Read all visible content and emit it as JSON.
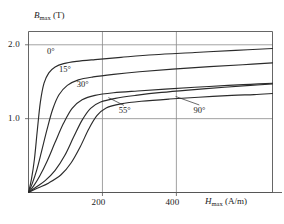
{
  "chart_data": {
    "type": "line",
    "title": "",
    "xlabel": "H_max (A/m)",
    "ylabel": "B_max (T)",
    "xlim": [
      0,
      660
    ],
    "ylim": [
      0,
      2.18
    ],
    "grid": true,
    "legend_position": "inline-annotations",
    "x_ticks": [
      {
        "value": 200,
        "label": "200"
      },
      {
        "value": 400,
        "label": "400"
      }
    ],
    "y_ticks": [
      {
        "value": 1.0,
        "label": "1.0"
      },
      {
        "value": 2.0,
        "label": "2.0"
      }
    ],
    "series": [
      {
        "name": "0°",
        "label": "0°",
        "points": [
          [
            0,
            0.0
          ],
          [
            8,
            0.18
          ],
          [
            16,
            0.45
          ],
          [
            24,
            0.85
          ],
          [
            32,
            1.22
          ],
          [
            42,
            1.48
          ],
          [
            55,
            1.62
          ],
          [
            72,
            1.7
          ],
          [
            95,
            1.745
          ],
          [
            130,
            1.775
          ],
          [
            180,
            1.8
          ],
          [
            250,
            1.83
          ],
          [
            340,
            1.865
          ],
          [
            450,
            1.895
          ],
          [
            560,
            1.925
          ],
          [
            660,
            1.95
          ]
        ]
      },
      {
        "name": "15°",
        "label": "15°",
        "points": [
          [
            0,
            0.0
          ],
          [
            10,
            0.12
          ],
          [
            22,
            0.3
          ],
          [
            35,
            0.55
          ],
          [
            50,
            0.85
          ],
          [
            65,
            1.12
          ],
          [
            82,
            1.32
          ],
          [
            105,
            1.45
          ],
          [
            135,
            1.525
          ],
          [
            175,
            1.565
          ],
          [
            230,
            1.6
          ],
          [
            300,
            1.635
          ],
          [
            390,
            1.67
          ],
          [
            490,
            1.705
          ],
          [
            580,
            1.73
          ],
          [
            660,
            1.755
          ]
        ]
      },
      {
        "name": "30°",
        "label": "30°",
        "points": [
          [
            0,
            0.0
          ],
          [
            14,
            0.09
          ],
          [
            30,
            0.22
          ],
          [
            50,
            0.42
          ],
          [
            72,
            0.68
          ],
          [
            95,
            0.94
          ],
          [
            118,
            1.14
          ],
          [
            145,
            1.255
          ],
          [
            180,
            1.315
          ],
          [
            230,
            1.35
          ],
          [
            295,
            1.375
          ],
          [
            370,
            1.4
          ],
          [
            450,
            1.425
          ],
          [
            540,
            1.45
          ],
          [
            600,
            1.465
          ],
          [
            660,
            1.48
          ]
        ]
      },
      {
        "name": "55°",
        "label": "55°",
        "points": [
          [
            0,
            0.0
          ],
          [
            20,
            0.07
          ],
          [
            45,
            0.16
          ],
          [
            72,
            0.3
          ],
          [
            98,
            0.5
          ],
          [
            122,
            0.75
          ],
          [
            145,
            0.98
          ],
          [
            168,
            1.14
          ],
          [
            195,
            1.225
          ],
          [
            235,
            1.275
          ],
          [
            290,
            1.315
          ],
          [
            360,
            1.355
          ],
          [
            440,
            1.39
          ],
          [
            530,
            1.425
          ],
          [
            600,
            1.45
          ],
          [
            660,
            1.47
          ]
        ]
      },
      {
        "name": "90°",
        "label": "90°",
        "points": [
          [
            0,
            0.0
          ],
          [
            25,
            0.06
          ],
          [
            55,
            0.13
          ],
          [
            88,
            0.24
          ],
          [
            115,
            0.4
          ],
          [
            140,
            0.62
          ],
          [
            163,
            0.86
          ],
          [
            185,
            1.04
          ],
          [
            210,
            1.145
          ],
          [
            250,
            1.2
          ],
          [
            305,
            1.235
          ],
          [
            380,
            1.265
          ],
          [
            460,
            1.29
          ],
          [
            550,
            1.315
          ],
          [
            610,
            1.325
          ],
          [
            660,
            1.34
          ]
        ]
      }
    ],
    "annotations": [
      {
        "text": "0°",
        "x": 72,
        "y": 1.9,
        "leader": false
      },
      {
        "text": "15°",
        "x": 104,
        "y": 1.66,
        "leader": false
      },
      {
        "text": "30°",
        "x": 152,
        "y": 1.45,
        "leader": false
      },
      {
        "text": "55°",
        "x": 266,
        "y": 1.1,
        "leader": true,
        "leader_from": [
          258,
          1.18
        ],
        "leader_to": [
          216,
          1.285
        ]
      },
      {
        "text": "90°",
        "x": 468,
        "y": 1.11,
        "leader": true,
        "leader_from": [
          462,
          1.185
        ],
        "leader_to": [
          398,
          1.3
        ]
      }
    ],
    "colors": {
      "curve": "#2b2b2b",
      "grid": "#8a8a8a",
      "frame": "#555555",
      "text": "#1a1a1a",
      "background": "#ffffff"
    }
  }
}
